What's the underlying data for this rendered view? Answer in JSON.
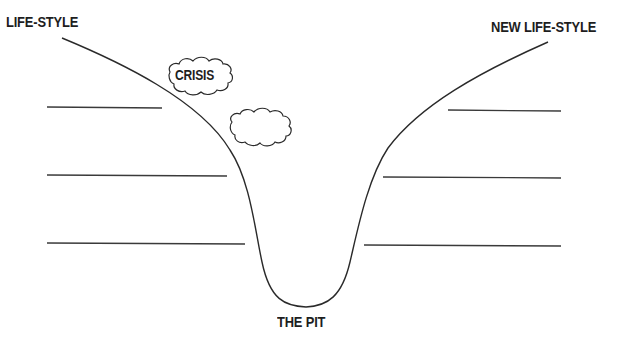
{
  "diagram": {
    "labels": {
      "start": "LIFE-STYLE",
      "end": "NEW LIFE-STYLE",
      "crisis": "CRISIS",
      "bottom": "THE PIT"
    },
    "clouds": [
      {
        "name": "crisis-cloud",
        "text": "CRISIS"
      },
      {
        "name": "empty-cloud",
        "text": ""
      }
    ],
    "blank_lines": {
      "left": [
        {
          "y": 107,
          "x1": 47,
          "x2": 162
        },
        {
          "y": 175,
          "x1": 47,
          "x2": 227
        },
        {
          "y": 243,
          "x1": 47,
          "x2": 245
        }
      ],
      "right": [
        {
          "y": 110,
          "x1": 448,
          "x2": 561
        },
        {
          "y": 177,
          "x1": 383,
          "x2": 561
        },
        {
          "y": 245,
          "x1": 364,
          "x2": 561
        }
      ]
    },
    "colors": {
      "stroke": "#2a2a2a",
      "text": "#1e1e1e",
      "background": "#ffffff"
    }
  }
}
